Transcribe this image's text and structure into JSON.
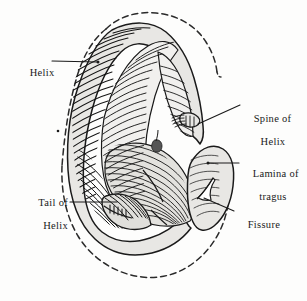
{
  "figure": {
    "background_color": "#fdfdfc",
    "ink_color": "#1a1a1a",
    "cartilage_fill": "#e8e7e4",
    "cartilage_fill_light": "#f1f0ee",
    "cartilage_fill_shadow": "#d8d7d3",
    "outline_style": "dashed",
    "drawing_style": "engraving-hatching"
  },
  "labels": {
    "helix": {
      "line1": "Helix"
    },
    "tail_of_helix": {
      "line1": "Tail of",
      "line2": "Helix"
    },
    "spine_of_helix": {
      "line1": "Spine of",
      "line2": "Helix"
    },
    "lamina_of_tragus": {
      "line1": "Lamina of",
      "line2": "tragus"
    },
    "fissure": {
      "line1": "Fissure"
    }
  },
  "leaders": {
    "helix": {
      "from_x": 52,
      "from_y": 60,
      "to_x": 98,
      "to_y": 63
    },
    "tail_of_helix": {
      "from_x": 70,
      "from_y": 202,
      "to_x": 118,
      "to_y": 202
    },
    "spine_of_helix": {
      "from_x": 239,
      "from_y": 105,
      "to_x": 196,
      "to_y": 124
    },
    "lamina_of_tragus": {
      "from_x": 238,
      "from_y": 163,
      "to_x": 206,
      "to_y": 163
    },
    "fissure": {
      "from_x": 233,
      "from_y": 211,
      "to_x": 205,
      "to_y": 199
    }
  },
  "marks": {
    "left_dot": {
      "x": 58,
      "y": 131,
      "r": 1.3
    }
  }
}
